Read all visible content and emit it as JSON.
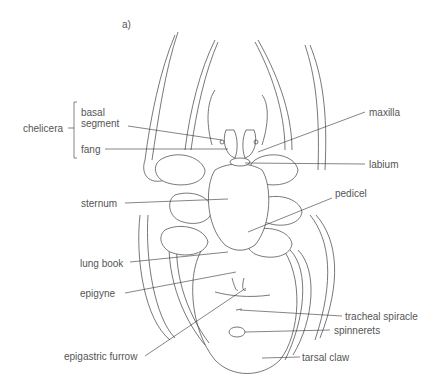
{
  "figure": {
    "panel_label": "a)",
    "group_label": "chelicera",
    "labels": {
      "basal_segment": "basal\nsegment",
      "basal_line1": "basal",
      "basal_line2": "segment",
      "fang": "fang",
      "sternum": "sternum",
      "lung_book": "lung book",
      "epigyne": "epigyne",
      "epigastric_furrow": "epigastric furrow",
      "maxilla": "maxilla",
      "labium": "labium",
      "pedicel": "pedicel",
      "tracheal_spiracle": "tracheal spiracle",
      "spinnerets": "spinnerets",
      "tarsal_claw": "tarsal claw"
    }
  }
}
